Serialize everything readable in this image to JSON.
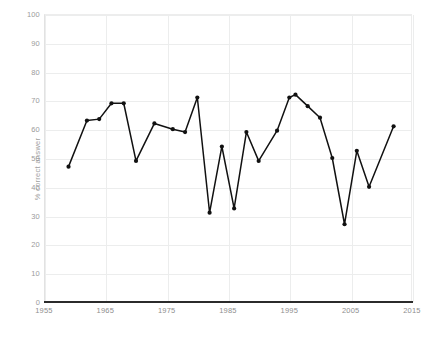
{
  "chart_data": {
    "type": "line",
    "title": "",
    "xlabel": "",
    "ylabel": "% correct answer",
    "xlim": [
      1955,
      2015
    ],
    "ylim": [
      0,
      100
    ],
    "grid": true,
    "legend": "none",
    "xticks": [
      "1955",
      "1965",
      "1975",
      "1985",
      "1995",
      "2005",
      "2015"
    ],
    "xtick_values": [
      1955,
      1965,
      1975,
      1985,
      1995,
      2005,
      2015
    ],
    "yticks": [
      "0",
      "10",
      "20",
      "30",
      "40",
      "50",
      "60",
      "70",
      "80",
      "90",
      "100"
    ],
    "ytick_values": [
      0,
      10,
      20,
      30,
      40,
      50,
      60,
      70,
      80,
      90,
      100
    ],
    "series": [
      {
        "name": "% correct answer",
        "color": "#111111",
        "marker": "circle",
        "x": [
          1959,
          1962,
          1964,
          1966,
          1968,
          1970,
          1973,
          1976,
          1978,
          1980,
          1982,
          1984,
          1986,
          1988,
          1990,
          1993,
          1995,
          1996,
          1998,
          2000,
          2002,
          2004,
          2006,
          2008,
          2012
        ],
        "values": [
          47,
          63,
          63.5,
          69,
          69,
          49,
          62,
          60,
          59,
          71,
          31,
          54,
          32.5,
          59,
          49,
          59.5,
          71,
          72,
          68,
          64,
          50,
          27,
          52.5,
          40,
          61
        ]
      }
    ]
  },
  "axes": {
    "y_title": "% correct answer"
  }
}
